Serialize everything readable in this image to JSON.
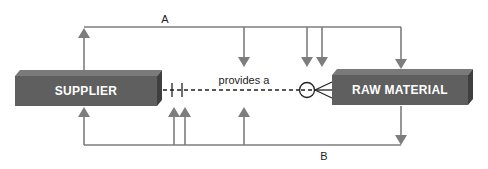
{
  "diagram": {
    "type": "entity-relationship",
    "colors": {
      "entity_front": "#5f5f5f",
      "entity_top": "#7a7a7a",
      "entity_side": "#3f3f3f",
      "flow_line": "#7d7d7d",
      "relationship_line": "#222222",
      "label_text": "#222222",
      "entity_text": "#ffffff"
    },
    "entities": [
      {
        "id": "supplier",
        "label": "SUPPLIER"
      },
      {
        "id": "raw_material",
        "label": "RAW MATERIAL"
      }
    ],
    "relationship": {
      "label": "provides a",
      "from": "supplier",
      "to": "raw_material",
      "from_cardinality": "exactly one (mandatory one)",
      "to_cardinality": "zero or many (optional many)",
      "line_style": "dashed"
    },
    "flows": [
      {
        "id": "A",
        "label": "A",
        "position": "top",
        "source_arrows_up": 1,
        "target_arrows_down": 4
      },
      {
        "id": "B",
        "label": "B",
        "position": "bottom",
        "source_arrows_down": 1,
        "target_arrows_up": 4
      }
    ]
  }
}
